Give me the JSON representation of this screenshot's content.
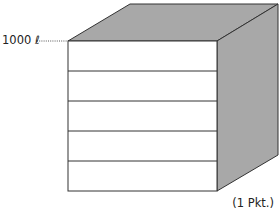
{
  "diagram": {
    "type": "cube-container",
    "capacity_label": "1000 ℓ",
    "points_label": "(1 Pkt.)",
    "front_face_divisions": 5,
    "colors": {
      "front_face": "#ffffff",
      "shaded_faces": "#a8a8a8",
      "edges": "#333333",
      "leader_line": "#555555"
    }
  }
}
